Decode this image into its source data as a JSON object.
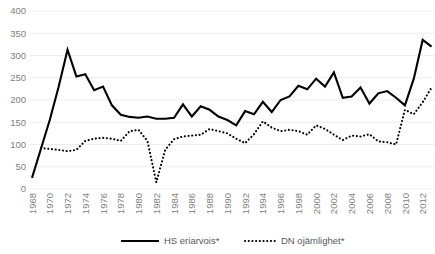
{
  "chart_data": {
    "type": "line",
    "title": "",
    "subtitle": "",
    "xlabel": "",
    "ylabel": "",
    "ylim": [
      0,
      400
    ],
    "ytick_values": [
      0,
      50,
      100,
      150,
      200,
      250,
      300,
      350,
      400
    ],
    "ytick_labels": [
      "0",
      "50",
      "100",
      "150",
      "200",
      "250",
      "300",
      "350",
      "400"
    ],
    "grid": true,
    "legend_position": "bottom",
    "xtick_labels": [
      "1968",
      "1970",
      "1972",
      "1974",
      "1976",
      "1978",
      "1980",
      "1982",
      "1984",
      "1986",
      "1988",
      "1990",
      "1992",
      "1994",
      "1996",
      "1998",
      "2000",
      "2002",
      "2004",
      "2006",
      "2008",
      "2010",
      "2012"
    ],
    "x": [
      1968,
      1969,
      1970,
      1971,
      1972,
      1973,
      1974,
      1975,
      1976,
      1977,
      1978,
      1979,
      1980,
      1981,
      1982,
      1983,
      1984,
      1985,
      1986,
      1987,
      1988,
      1989,
      1990,
      1991,
      1992,
      1993,
      1994,
      1995,
      1996,
      1997,
      1998,
      1999,
      2000,
      2001,
      2002,
      2003,
      2004,
      2005,
      2006,
      2007,
      2008,
      2009,
      2010,
      2011,
      2012,
      2013
    ],
    "series": [
      {
        "name": "HS eriarvois*",
        "style": "solid",
        "values": [
          25,
          90,
          155,
          230,
          313,
          253,
          258,
          222,
          230,
          188,
          167,
          162,
          160,
          163,
          158,
          158,
          160,
          190,
          163,
          186,
          178,
          163,
          155,
          143,
          175,
          168,
          196,
          173,
          200,
          208,
          232,
          224,
          248,
          230,
          262,
          205,
          208,
          228,
          192,
          215,
          220,
          205,
          188,
          248,
          335,
          320
        ]
      },
      {
        "name": "DN ojämlighet*",
        "style": "dotted",
        "values": [
          null,
          92,
          90,
          88,
          85,
          88,
          108,
          113,
          115,
          113,
          108,
          130,
          133,
          108,
          15,
          88,
          112,
          118,
          120,
          122,
          135,
          130,
          125,
          113,
          103,
          123,
          152,
          138,
          130,
          133,
          130,
          122,
          143,
          135,
          122,
          110,
          120,
          118,
          123,
          107,
          105,
          100,
          178,
          168,
          195,
          228
        ]
      }
    ]
  },
  "legend": [
    {
      "label": "HS eriarvois*",
      "style": "solid"
    },
    {
      "label": "DN ojämlighet*",
      "style": "dotted"
    }
  ],
  "colors": {
    "series": "#000000",
    "grid": "#e8e8e8",
    "tick_text": "#808080",
    "legend_text": "#595959"
  }
}
